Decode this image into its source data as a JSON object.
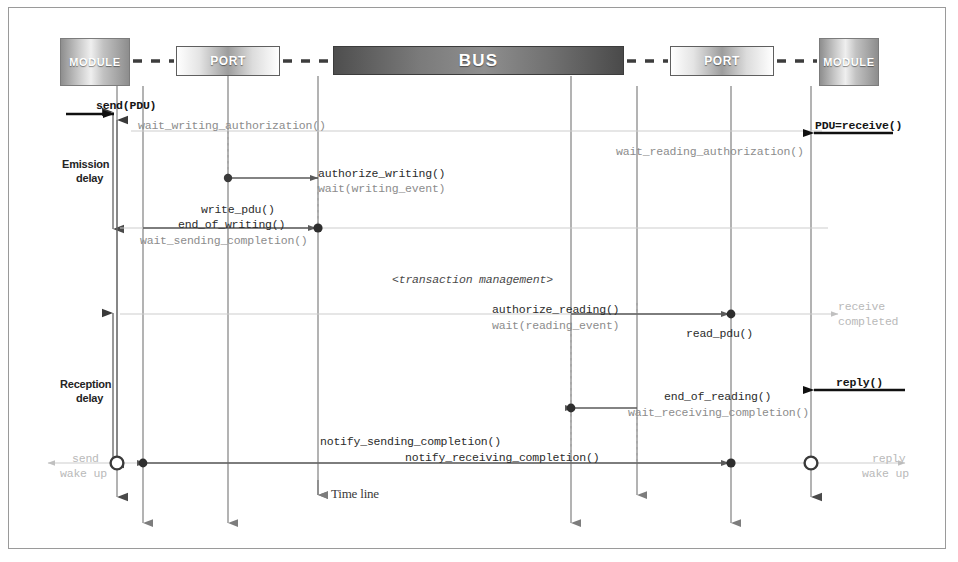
{
  "diagram": {
    "timeline_label": "Time line",
    "transaction_note": "<transaction management>"
  },
  "participants": [
    {
      "id": "module_left",
      "label": "MODULE",
      "kind": "module",
      "x": 95,
      "box": {
        "left": 60,
        "top": 38,
        "width": 70,
        "height": 48
      }
    },
    {
      "id": "port_left",
      "label": "PORT",
      "kind": "port",
      "x": 228,
      "box": {
        "left": 176,
        "top": 46,
        "width": 104,
        "height": 30
      }
    },
    {
      "id": "bus",
      "label": "BUS",
      "kind": "bus",
      "x": 478,
      "box": {
        "left": 333,
        "top": 46,
        "width": 291,
        "height": 29
      }
    },
    {
      "id": "port_right",
      "label": "PORT",
      "kind": "port",
      "x": 722,
      "box": {
        "left": 670,
        "top": 46,
        "width": 104,
        "height": 30
      }
    },
    {
      "id": "module_right",
      "label": "MODULE",
      "kind": "module",
      "x": 843,
      "box": {
        "left": 819,
        "top": 38,
        "width": 60,
        "height": 48
      }
    }
  ],
  "delay_markers": [
    {
      "id": "emission",
      "label_line1": "Emission",
      "label_line2": "delay",
      "label_x": 62,
      "label_y": 158,
      "bar_x": 113,
      "y_from": 113,
      "y_to": 228
    },
    {
      "id": "reception",
      "label_line1": "Reception",
      "label_line2": "delay",
      "label_x": 60,
      "label_y": 378,
      "bar_x": 113,
      "y_from": 314,
      "y_to": 463
    }
  ],
  "messages": [
    {
      "id": "send_pdu",
      "text": "send(PDU)",
      "style": "bold",
      "x": 96,
      "y": 99
    },
    {
      "id": "pdu_receive",
      "text": "PDU=receive()",
      "style": "bold",
      "x": 815,
      "y": 119
    },
    {
      "id": "wait_writing_authorization",
      "text": "wait_writing_authorization()",
      "style": "mono-gray",
      "x": 138,
      "y": 119
    },
    {
      "id": "wait_reading_authorization",
      "text": "wait_reading_authorization()",
      "style": "mono-gray",
      "x": 616,
      "y": 145
    },
    {
      "id": "authorize_writing",
      "text": "authorize_writing()",
      "style": "mono-dark",
      "x": 318,
      "y": 167
    },
    {
      "id": "wait_writing_event",
      "text": "wait(writing_event)",
      "style": "mono-gray",
      "x": 318,
      "y": 182
    },
    {
      "id": "write_pdu",
      "text": "write_pdu()",
      "style": "mono-dark",
      "x": 201,
      "y": 203
    },
    {
      "id": "end_of_writing",
      "text": "end_of_writing()",
      "style": "mono-dark",
      "x": 178,
      "y": 218
    },
    {
      "id": "wait_sending_completion",
      "text": "wait_sending_completion()",
      "style": "mono-gray",
      "x": 140,
      "y": 234
    },
    {
      "id": "transaction_management",
      "text": "<transaction management>",
      "style": "italic",
      "x": 392,
      "y": 273
    },
    {
      "id": "authorize_reading",
      "text": "authorize_reading()",
      "style": "mono-dark",
      "x": 492,
      "y": 303
    },
    {
      "id": "wait_reading_event",
      "text": "wait(reading_event)",
      "style": "mono-gray",
      "x": 492,
      "y": 319
    },
    {
      "id": "read_pdu",
      "text": "read_pdu()",
      "style": "mono-dark",
      "x": 686,
      "y": 327
    },
    {
      "id": "receive_completed_1",
      "text": "receive",
      "style": "mono-faint",
      "x": 838,
      "y": 300
    },
    {
      "id": "receive_completed_2",
      "text": "completed",
      "style": "mono-faint",
      "x": 838,
      "y": 315
    },
    {
      "id": "reply",
      "text": "reply()",
      "style": "bold",
      "x": 836,
      "y": 376
    },
    {
      "id": "end_of_reading",
      "text": "end_of_reading()",
      "style": "mono-dark",
      "x": 664,
      "y": 390
    },
    {
      "id": "wait_receiving_completion",
      "text": "wait_receiving_completion()",
      "style": "mono-gray",
      "x": 628,
      "y": 406
    },
    {
      "id": "notify_sending_completion",
      "text": "notify_sending_completion()",
      "style": "mono-dark",
      "x": 320,
      "y": 435
    },
    {
      "id": "notify_receiving_completion",
      "text": "notify_receiving_completion()",
      "style": "mono-dark",
      "x": 405,
      "y": 451
    },
    {
      "id": "send_wake_up_1",
      "text": "send",
      "style": "mono-faint",
      "x": 72,
      "y": 452
    },
    {
      "id": "send_wake_up_2",
      "text": "wake up",
      "style": "mono-faint",
      "x": 68,
      "y": 467
    },
    {
      "id": "reply_wake_up_1",
      "text": "reply",
      "style": "mono-faint",
      "x": 872,
      "y": 452
    },
    {
      "id": "reply_wake_up_2",
      "text": "wake up",
      "style": "mono-faint",
      "x": 868,
      "y": 467
    }
  ],
  "timeline": {
    "label": "Time line",
    "label_x": 331,
    "label_y": 495
  },
  "colors": {
    "frame": "#9a9a9a",
    "lifeline": "#7a7a7a",
    "message_solid": "#555555",
    "message_faint": "#bdbdbd",
    "bold_arrow": "#101010",
    "text_dark": "#2b2b2b",
    "text_gray": "#8c8c8c",
    "text_faint": "#b9b9b9",
    "bus_fill": "#6f6f6f"
  }
}
